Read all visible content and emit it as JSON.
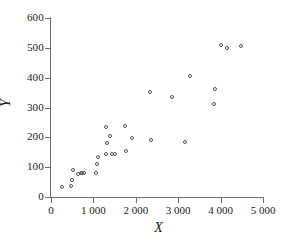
{
  "chart_data": {
    "type": "scatter",
    "title": "",
    "xlabel": "X",
    "ylabel": "Y",
    "xlim": [
      0,
      5000
    ],
    "ylim": [
      0,
      600
    ],
    "grid": false,
    "legend": null,
    "xticks": [
      0,
      1000,
      2000,
      3000,
      4000,
      5000
    ],
    "xticklabels": [
      "0",
      "1 000",
      "2 000",
      "3 000",
      "4 000",
      "5 000"
    ],
    "yticks": [
      0,
      100,
      200,
      300,
      400,
      500,
      600
    ],
    "yticklabels": [
      "0",
      "100",
      "200",
      "300",
      "400",
      "500",
      "600"
    ],
    "marker": "open-circle",
    "marker_color": "#555555",
    "points": [
      {
        "x": 260,
        "y": 35
      },
      {
        "x": 470,
        "y": 37
      },
      {
        "x": 500,
        "y": 57
      },
      {
        "x": 520,
        "y": 92
      },
      {
        "x": 640,
        "y": 78
      },
      {
        "x": 700,
        "y": 80
      },
      {
        "x": 730,
        "y": 81
      },
      {
        "x": 790,
        "y": 80
      },
      {
        "x": 1060,
        "y": 81
      },
      {
        "x": 1090,
        "y": 112
      },
      {
        "x": 1110,
        "y": 134
      },
      {
        "x": 1290,
        "y": 236
      },
      {
        "x": 1300,
        "y": 145
      },
      {
        "x": 1330,
        "y": 182
      },
      {
        "x": 1400,
        "y": 206
      },
      {
        "x": 1430,
        "y": 143
      },
      {
        "x": 1520,
        "y": 143
      },
      {
        "x": 1740,
        "y": 237
      },
      {
        "x": 1760,
        "y": 155
      },
      {
        "x": 1920,
        "y": 198
      },
      {
        "x": 2330,
        "y": 352
      },
      {
        "x": 2350,
        "y": 192
      },
      {
        "x": 2860,
        "y": 336
      },
      {
        "x": 3170,
        "y": 183
      },
      {
        "x": 3270,
        "y": 405
      },
      {
        "x": 3840,
        "y": 313
      },
      {
        "x": 3860,
        "y": 362
      },
      {
        "x": 4000,
        "y": 509
      },
      {
        "x": 4160,
        "y": 499
      },
      {
        "x": 4480,
        "y": 505
      }
    ]
  }
}
